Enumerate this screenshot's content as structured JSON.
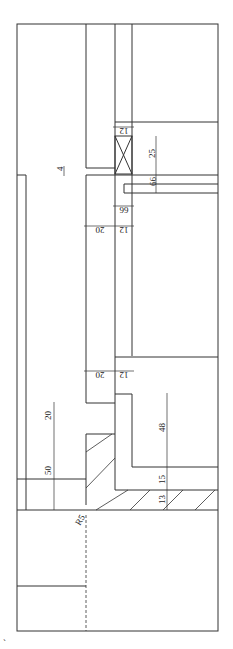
{
  "drawing": {
    "type": "architectural section detail",
    "dimensions": {
      "d12_top": "12",
      "d25": "25",
      "d4": "4",
      "d6a": "6",
      "d6b": "6",
      "d6c": "6",
      "d6d": "6",
      "d20a": "20",
      "d12a": "12",
      "d20b": "20",
      "d12b": "12",
      "d20c": "20",
      "d50": "50",
      "d48": "48",
      "d15": "15",
      "d13": "13",
      "r5": "R5"
    },
    "mark": "`"
  }
}
